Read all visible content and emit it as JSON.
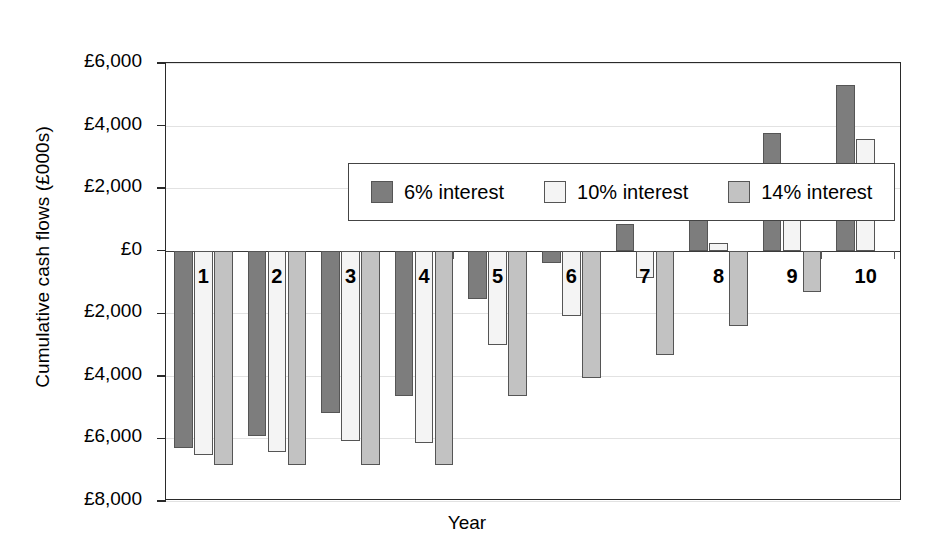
{
  "chart_data": {
    "type": "bar",
    "title": "",
    "xlabel": "Year",
    "ylabel": "Cumulative cash flows (£000s)",
    "categories": [
      "1",
      "2",
      "3",
      "4",
      "5",
      "6",
      "7",
      "8",
      "9",
      "10"
    ],
    "ylim": [
      -8000,
      6000
    ],
    "ytick_values": [
      6000,
      4000,
      2000,
      0,
      -2000,
      -4000,
      -6000,
      -8000
    ],
    "ytick_labels": [
      "£6,000",
      "£4,000",
      "£2,000",
      "£0",
      "£2,000",
      "£4,000",
      "£6,000",
      "£8,000"
    ],
    "grid": true,
    "legend_position": "top-left-inside",
    "series": [
      {
        "name": "6% interest",
        "color": "#7d7d7d",
        "values": [
          -6300,
          -5930,
          -5200,
          -4650,
          -1540,
          -400,
          850,
          2290,
          3770,
          5310
        ]
      },
      {
        "name": "10% interest",
        "color": "#f4f4f4",
        "values": [
          -6530,
          -6430,
          -6080,
          -6150,
          -3020,
          -2100,
          -880,
          260,
          1930,
          3570
        ]
      },
      {
        "name": "14% interest",
        "color": "#c2c2c2",
        "values": [
          -6850,
          -6850,
          -6850,
          -6850,
          -4660,
          -4070,
          -3340,
          -2420,
          -1310,
          0
        ]
      }
    ]
  }
}
